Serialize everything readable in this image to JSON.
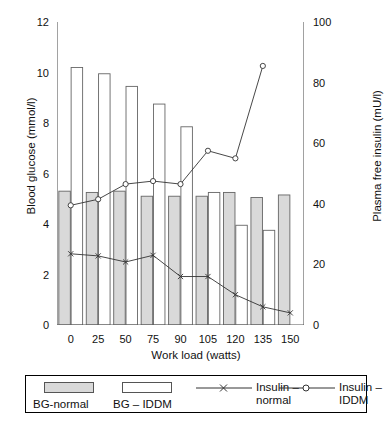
{
  "chart_data": {
    "type": "bar",
    "title": "",
    "xlabel": "Work load (watts)",
    "ylabel": "Blood glucose (mmol/l)",
    "y2label": "Plasma free insulin (mU/l)",
    "categories": [
      "0",
      "25",
      "50",
      "75",
      "90",
      "105",
      "120",
      "135",
      "150"
    ],
    "ylim": [
      0,
      12
    ],
    "yticks": [
      "0",
      "2",
      "4",
      "6",
      "8",
      "10",
      "12"
    ],
    "y2lim": [
      0,
      100
    ],
    "y2ticks": [
      "0",
      "20",
      "40",
      "60",
      "80",
      "100"
    ],
    "grid": false,
    "legend_position": "bottom",
    "series": [
      {
        "name": "BG-normal",
        "kind": "bar",
        "axis": "left",
        "fill": "#d9d9d9",
        "values": [
          5.3,
          5.25,
          5.3,
          5.1,
          5.1,
          5.1,
          5.25,
          5.05,
          5.15
        ]
      },
      {
        "name": "BG – IDDM",
        "kind": "bar",
        "axis": "left",
        "fill": "#ffffff",
        "values": [
          10.2,
          9.95,
          9.45,
          8.75,
          7.85,
          5.25,
          3.95,
          3.75,
          null
        ]
      },
      {
        "name": "Insulin – normal",
        "kind": "line",
        "axis": "right",
        "marker": "x",
        "values": [
          23.5,
          22.8,
          20.8,
          23.0,
          16.0,
          16.0,
          10.0,
          6.0,
          4.0
        ]
      },
      {
        "name": "Insulin – IDDM",
        "kind": "line",
        "axis": "right",
        "marker": "circle",
        "values": [
          39.5,
          41.5,
          46.5,
          47.5,
          46.5,
          57.5,
          55.0,
          85.5,
          null
        ]
      }
    ]
  },
  "legend": {
    "items": [
      {
        "label": "BG-normal",
        "icon": "shaded-box-icon"
      },
      {
        "label": "BG – IDDM",
        "icon": "white-box-icon"
      },
      {
        "label_line1": "Insulin –",
        "label_line2": "normal",
        "icon": "line-x-marker-icon"
      },
      {
        "label_line1": "Insulin –",
        "label_line2": "IDDM",
        "icon": "line-circle-marker-icon"
      }
    ]
  },
  "colors": {
    "axis": "#555555",
    "bar_outline": "#666666",
    "bar_shaded_fill": "#d9d9d9",
    "bar_white_fill": "#ffffff",
    "line": "#333333",
    "text": "#111111"
  }
}
